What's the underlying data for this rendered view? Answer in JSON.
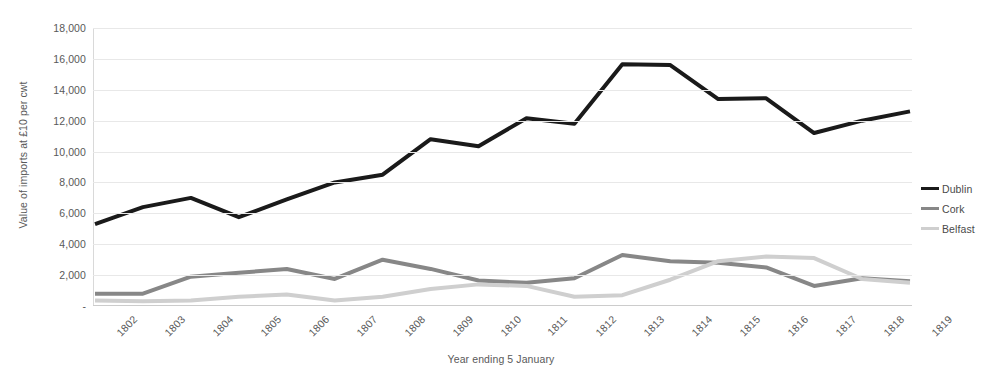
{
  "chart_data": {
    "type": "line",
    "title": "",
    "xlabel": "Year ending 5 January",
    "ylabel": "Value of imports at £10 per cwt",
    "categories": [
      "1802",
      "1803",
      "1804",
      "1805",
      "1806",
      "1807",
      "1808",
      "1809",
      "1810",
      "1811",
      "1812",
      "1813",
      "1814",
      "1815",
      "1816",
      "1817",
      "1818",
      "1819"
    ],
    "ylim": [
      0,
      18000
    ],
    "ytick_labels": [
      "-",
      "2,000",
      "4,000",
      "6,000",
      "8,000",
      "10,000",
      "12,000",
      "14,000",
      "16,000",
      "18,000"
    ],
    "ytick_values": [
      0,
      2000,
      4000,
      6000,
      8000,
      10000,
      12000,
      14000,
      16000,
      18000
    ],
    "grid": true,
    "legend_position": "right",
    "series": [
      {
        "name": "Dublin",
        "color": "#1a1a1a",
        "width": 4,
        "values": [
          5300,
          6400,
          7000,
          5750,
          6900,
          8000,
          8500,
          10800,
          10350,
          12150,
          11800,
          15650,
          15600,
          13400,
          13450,
          11200,
          12000,
          12600
        ]
      },
      {
        "name": "Cork",
        "color": "#878787",
        "width": 4,
        "values": [
          800,
          800,
          1900,
          2150,
          2400,
          1750,
          3000,
          2400,
          1650,
          1500,
          1800,
          3300,
          2900,
          2800,
          2500,
          1300,
          1800,
          1600
        ]
      },
      {
        "name": "Belfast",
        "color": "#cfcfcf",
        "width": 4,
        "values": [
          350,
          300,
          350,
          600,
          750,
          350,
          600,
          1100,
          1400,
          1300,
          600,
          700,
          1700,
          2900,
          3200,
          3100,
          1750,
          1500
        ]
      }
    ]
  },
  "legend": {
    "items": [
      {
        "label": "Dublin"
      },
      {
        "label": "Cork"
      },
      {
        "label": "Belfast"
      }
    ]
  },
  "axes": {
    "y_title": "Value of imports at £10 per cwt",
    "x_title": "Year ending 5 January"
  }
}
